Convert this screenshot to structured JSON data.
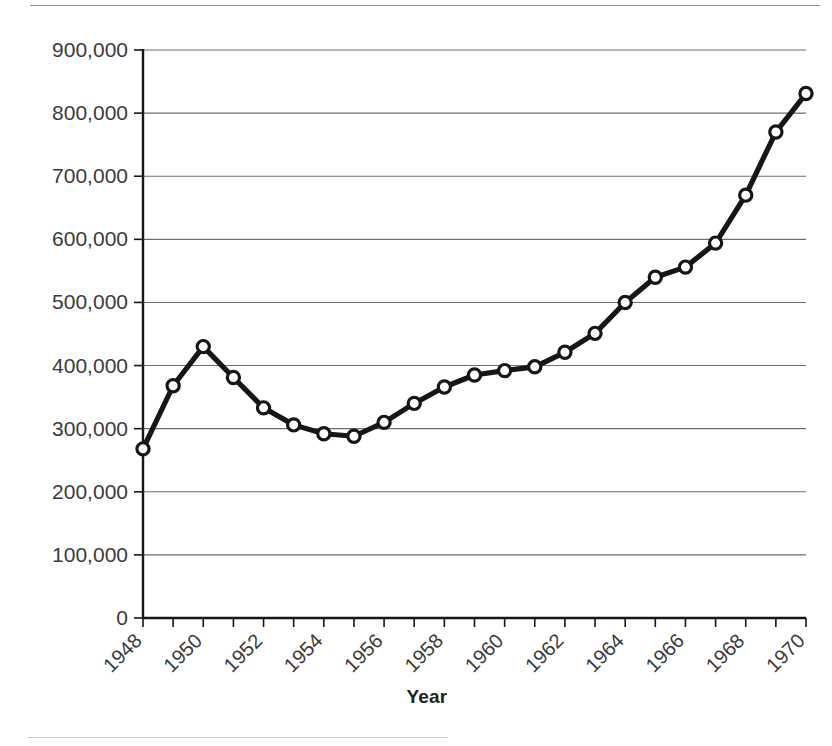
{
  "chart_data": {
    "type": "line",
    "title": "",
    "xlabel": "Year",
    "ylabel": "",
    "x": [
      1948,
      1949,
      1950,
      1951,
      1952,
      1953,
      1954,
      1955,
      1956,
      1957,
      1958,
      1959,
      1960,
      1961,
      1962,
      1963,
      1964,
      1965,
      1966,
      1967,
      1968,
      1969,
      1970
    ],
    "values": [
      268000,
      368000,
      430000,
      381000,
      333000,
      306000,
      292000,
      288000,
      310000,
      340000,
      366000,
      385000,
      392000,
      398000,
      421000,
      451000,
      500000,
      540000,
      556000,
      594000,
      670000,
      770000,
      831000
    ],
    "series": [
      {
        "name": "series-1",
        "values": [
          268000,
          368000,
          430000,
          381000,
          333000,
          306000,
          292000,
          288000,
          310000,
          340000,
          366000,
          385000,
          392000,
          398000,
          421000,
          451000,
          500000,
          540000,
          556000,
          594000,
          670000,
          770000,
          831000
        ]
      }
    ],
    "xlim": [
      1948,
      1970
    ],
    "ylim": [
      0,
      900000
    ],
    "yticks": [
      0,
      100000,
      200000,
      300000,
      400000,
      500000,
      600000,
      700000,
      800000,
      900000
    ],
    "ytick_labels": [
      "0",
      "100,000",
      "200,000",
      "300,000",
      "400,000",
      "500,000",
      "600,000",
      "700,000",
      "800,000",
      "900,000"
    ],
    "xticks": [
      1948,
      1949,
      1950,
      1951,
      1952,
      1953,
      1954,
      1955,
      1956,
      1957,
      1958,
      1959,
      1960,
      1961,
      1962,
      1963,
      1964,
      1965,
      1966,
      1967,
      1968,
      1969,
      1970
    ],
    "xtick_labels": [
      "1948",
      "1950",
      "1952",
      "1954",
      "1956",
      "1958",
      "1960",
      "1962",
      "1964",
      "1966",
      "1968",
      "1970"
    ],
    "xtick_label_years": [
      1948,
      1950,
      1952,
      1954,
      1956,
      1958,
      1960,
      1962,
      1964,
      1966,
      1968,
      1970
    ],
    "xtick_label_rotation": -45,
    "grid": "horizontal",
    "legend": "none",
    "marker": "open-circle",
    "line_color": "#161616",
    "marker_face_color": "#ffffff",
    "grid_color": "#6e6e6e",
    "axis_color": "#161616"
  },
  "axis_title": {
    "x": "Year"
  }
}
